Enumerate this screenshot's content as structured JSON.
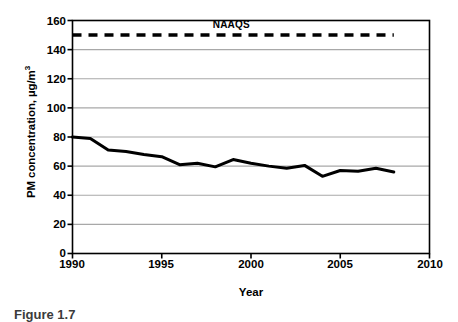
{
  "figure": {
    "caption": "Figure 1.7",
    "annotation_label": "NAAQS"
  },
  "chart_data": {
    "type": "line",
    "title": "",
    "xlabel": "Year",
    "ylabel": "PM concentration, µg/m³",
    "ylabel_main": "PM concentration, µg/m",
    "ylabel_exponent": "3",
    "xlim": [
      1990,
      2010
    ],
    "ylim": [
      0,
      160
    ],
    "grid": "horizontal",
    "legend": "none",
    "x_ticks": [
      1990,
      1995,
      2000,
      2005,
      2010
    ],
    "x_tick_labels": [
      "1990",
      "1995",
      "2000",
      "2005",
      "2010"
    ],
    "y_ticks": [
      0,
      20,
      40,
      60,
      80,
      100,
      120,
      140,
      160
    ],
    "y_tick_labels": [
      "0",
      "20",
      "40",
      "60",
      "80",
      "100",
      "120",
      "140",
      "160"
    ],
    "x": [
      1990,
      1991,
      1992,
      1993,
      1994,
      1995,
      1996,
      1997,
      1998,
      1999,
      2000,
      2001,
      2002,
      2003,
      2004,
      2005,
      2006,
      2007,
      2008
    ],
    "series": [
      {
        "name": "PM concentration",
        "style": "solid",
        "color": "#000000",
        "width": 3,
        "values": [
          80,
          79,
          71,
          70,
          68,
          66.5,
          61,
          62,
          59.5,
          64.5,
          62,
          60,
          58.5,
          60.5,
          53,
          57,
          56.5,
          58.5,
          56
        ]
      },
      {
        "name": "NAAQS",
        "style": "dashed",
        "color": "#000000",
        "width": 3.5,
        "constant_value": 150,
        "x_start": 1990,
        "x_end": 2008
      }
    ],
    "annotations": [
      {
        "text": "NAAQS",
        "x": 1999.2,
        "y": 157,
        "bold": true
      }
    ]
  },
  "colors": {
    "axis": "#000000",
    "grid": "#a8a8a8",
    "series": "#000000",
    "background": "#ffffff",
    "caption": "#3b3b3b"
  }
}
